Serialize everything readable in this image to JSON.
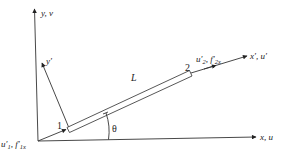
{
  "diagram": {
    "type": "bar-element-coordinate-transformation",
    "axes": {
      "global_y_label": "y, v",
      "global_x_label": "x, u",
      "local_y_label": "y′",
      "local_x_label": "x′, u′"
    },
    "element": {
      "length_label": "L",
      "angle_label": "θ",
      "node1_label": "1",
      "node2_label": "2"
    },
    "node1": {
      "disp": "u′",
      "disp_sub": "1",
      "sep": ", ",
      "force": "f′",
      "force_sub": "1x"
    },
    "node2": {
      "disp": "u′",
      "disp_sub": "2",
      "sep": ", ",
      "force": "f′",
      "force_sub": "2x"
    },
    "colors": {
      "line": "#333333",
      "text": "#222222",
      "background": "#ffffff"
    }
  }
}
